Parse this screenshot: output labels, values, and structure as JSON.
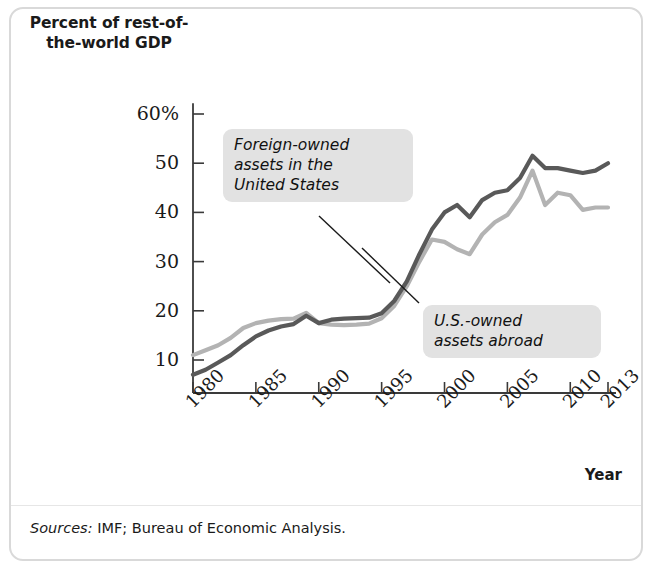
{
  "figure": {
    "y_axis_title": "Percent of\nrest-of-the-world\nGDP",
    "x_axis_title": "Year",
    "sources_label": "Sources:",
    "sources_text": "IMF; Bureau of Economic Analysis.",
    "annotation_foreign": "Foreign-owned\nassets in the\nUnited States",
    "annotation_us": "U.S.-owned\nassets abroad",
    "color_foreign": "#595959",
    "color_us": "#b3b3b3",
    "color_axis": "#3a3a3a",
    "color_callout_bg": "#e2e2e2",
    "color_border": "#d9d9d9"
  },
  "chart_data": {
    "type": "line",
    "title": "Percent of rest-of-the-world GDP",
    "xlabel": "Year",
    "ylabel": "Percent of rest-of-the-world GDP",
    "xlim": [
      1980,
      2013
    ],
    "ylim": [
      0,
      60
    ],
    "yticks": [
      10,
      20,
      30,
      40,
      50,
      60
    ],
    "ytick_labels": [
      "10",
      "20",
      "30",
      "40",
      "50",
      "60%"
    ],
    "xticks": [
      1980,
      1985,
      1990,
      1995,
      2000,
      2005,
      2010,
      2013
    ],
    "xtick_labels": [
      "1980",
      "1985",
      "1990",
      "1995",
      "2000",
      "2005",
      "2010",
      "2013"
    ],
    "grid": false,
    "legend": "annotations",
    "x": [
      1980,
      1981,
      1982,
      1983,
      1984,
      1985,
      1986,
      1987,
      1988,
      1989,
      1990,
      1991,
      1992,
      1993,
      1994,
      1995,
      1996,
      1997,
      1998,
      1999,
      2000,
      2001,
      2002,
      2003,
      2004,
      2005,
      2006,
      2007,
      2008,
      2009,
      2010,
      2011,
      2012,
      2013
    ],
    "series": [
      {
        "name": "Foreign-owned assets in the United States",
        "color": "#595959",
        "values": [
          7.0,
          8.0,
          9.5,
          11.0,
          13.0,
          14.8,
          16.0,
          16.8,
          17.3,
          19.0,
          17.5,
          18.2,
          18.4,
          18.5,
          18.6,
          19.5,
          22.0,
          26.0,
          31.5,
          36.5,
          40.0,
          41.5,
          39.0,
          42.5,
          44.0,
          44.5,
          47.0,
          51.5,
          49.0,
          49.0,
          48.5,
          48.0,
          48.5,
          50.0
        ]
      },
      {
        "name": "U.S.-owned assets abroad",
        "color": "#b3b3b3",
        "values": [
          11.0,
          12.0,
          13.0,
          14.5,
          16.5,
          17.5,
          18.0,
          18.3,
          18.4,
          19.6,
          17.5,
          17.2,
          17.1,
          17.2,
          17.4,
          18.5,
          21.0,
          25.0,
          30.0,
          34.5,
          34.0,
          32.5,
          31.5,
          35.5,
          38.0,
          39.5,
          43.0,
          48.5,
          41.5,
          44.0,
          43.5,
          40.5,
          41.0,
          41.0
        ]
      }
    ]
  }
}
